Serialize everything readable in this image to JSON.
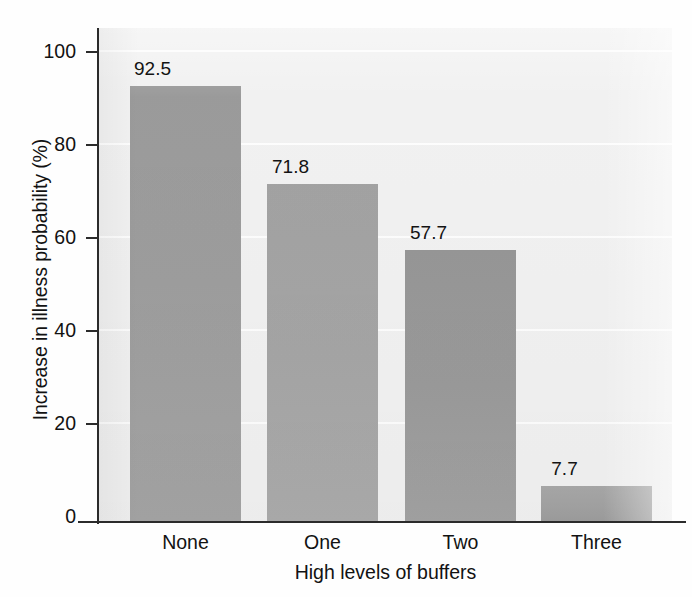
{
  "chart_data": {
    "type": "bar",
    "title": "",
    "subtitle": "",
    "categories": [
      "None",
      "One",
      "Two",
      "Three"
    ],
    "values": [
      92.5,
      71.8,
      57.7,
      7.7
    ],
    "value_labels": [
      "92.5",
      "71.8",
      "57.7",
      "7.7"
    ],
    "xlabel": "High levels of buffers",
    "ylabel": "Increase in illness probability (%)",
    "ylim": [
      0,
      100
    ],
    "xlim_note": "categorical",
    "ytick_labels": [
      "0",
      "20",
      "40",
      "60",
      "80",
      "100"
    ],
    "ytick_values": [
      0,
      20,
      40,
      60,
      80,
      100
    ],
    "grid": "horizontal-white-gridlines",
    "legend": "none",
    "legend_position": "none",
    "annotations": [],
    "colors": {
      "bar_fill": "#9d9d9d",
      "plot_background": "#f1f1f1",
      "gridline": "#fdfdfd",
      "axis": "#2b2b2b",
      "text": "#121212",
      "figure_background": "#fefefe"
    }
  }
}
